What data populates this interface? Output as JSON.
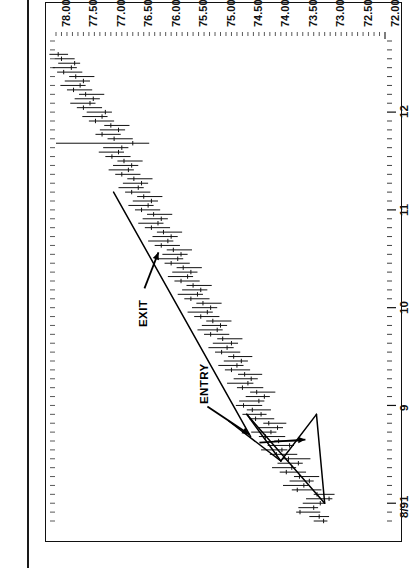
{
  "figure": {
    "title": "December 1991—Japanese Yen",
    "orientation": "rotated-90-ccw",
    "background": "#ffffff",
    "ink_color": "#111111"
  },
  "annotations": [
    {
      "name": "exit",
      "label": "EXIT",
      "arrow": "points-up-right-to-trendline"
    },
    {
      "name": "entry",
      "label": "ENTRY",
      "arrow": "points-down-left-to-breakout"
    }
  ],
  "chart_data": {
    "type": "line",
    "subtype": "ohlc-bar-chart",
    "title": "December 1991—Japanese Yen",
    "xlabel": "",
    "ylabel": "",
    "grid": false,
    "legend": false,
    "ylim": [
      72.0,
      78.0
    ],
    "yticks": [
      78.0,
      77.5,
      77.0,
      76.5,
      76.0,
      75.5,
      75.0,
      74.5,
      74.0,
      73.5,
      73.0,
      72.5,
      72.0
    ],
    "ytick_labels": [
      "78.00",
      "77.50",
      "77.00",
      "76.50",
      "76.00",
      "75.50",
      "75.00",
      "74.50",
      "74.00",
      "73.50",
      "73.00",
      "72.50",
      "72.00"
    ],
    "xtick_labels": [
      "8/91",
      "9",
      "10",
      "11",
      "12"
    ],
    "xtick_positions": [
      4,
      26,
      48,
      70,
      92
    ],
    "xlim": [
      0,
      108
    ],
    "minor_xticks_between": 4,
    "series": [
      {
        "name": "December 1991 Japanese Yen futures (daily OHLC)",
        "fields": [
          "index",
          "high",
          "low",
          "close"
        ],
        "bars": [
          [
            0,
            73.3,
            73.05,
            73.12
          ],
          [
            1,
            73.38,
            73.02,
            73.2
          ],
          [
            2,
            73.62,
            73.18,
            73.55
          ],
          [
            3,
            73.58,
            73.22,
            73.3
          ],
          [
            4,
            73.5,
            73.1,
            73.18
          ],
          [
            5,
            73.44,
            72.96,
            73.02
          ],
          [
            6,
            73.3,
            72.92,
            73.24
          ],
          [
            7,
            73.7,
            73.16,
            73.6
          ],
          [
            8,
            73.86,
            73.4,
            73.48
          ],
          [
            9,
            73.74,
            73.3,
            73.38
          ],
          [
            10,
            73.66,
            73.2,
            73.56
          ],
          [
            11,
            73.92,
            73.44,
            73.8
          ],
          [
            12,
            74.06,
            73.62,
            73.7
          ],
          [
            13,
            73.96,
            73.5,
            73.58
          ],
          [
            14,
            73.88,
            73.36,
            73.76
          ],
          [
            15,
            74.1,
            73.6,
            73.98
          ],
          [
            16,
            74.26,
            73.78,
            73.88
          ],
          [
            17,
            74.14,
            73.66,
            73.74
          ],
          [
            18,
            74.02,
            73.58,
            73.94
          ],
          [
            19,
            74.3,
            73.82,
            74.18
          ],
          [
            20,
            74.44,
            73.98,
            74.08
          ],
          [
            21,
            74.32,
            73.86,
            73.96
          ],
          [
            22,
            74.22,
            73.8,
            74.12
          ],
          [
            23,
            74.48,
            74.02,
            74.36
          ],
          [
            24,
            74.6,
            74.16,
            74.26
          ],
          [
            25,
            74.52,
            74.08,
            74.42
          ],
          [
            26,
            74.72,
            74.24,
            74.58
          ],
          [
            27,
            74.66,
            74.2,
            74.3
          ],
          [
            28,
            74.54,
            74.1,
            74.2
          ],
          [
            29,
            74.46,
            74.0,
            74.34
          ],
          [
            30,
            74.7,
            74.22,
            74.6
          ],
          [
            31,
            74.88,
            74.4,
            74.5
          ],
          [
            32,
            74.76,
            74.32,
            74.44
          ],
          [
            33,
            74.68,
            74.24,
            74.56
          ],
          [
            34,
            74.92,
            74.46,
            74.8
          ],
          [
            35,
            75.04,
            74.58,
            74.7
          ],
          [
            36,
            74.94,
            74.5,
            74.62
          ],
          [
            37,
            74.86,
            74.42,
            74.76
          ],
          [
            38,
            75.1,
            74.64,
            74.98
          ],
          [
            39,
            75.22,
            74.76,
            74.88
          ],
          [
            40,
            75.14,
            74.68,
            74.8
          ],
          [
            41,
            75.06,
            74.6,
            74.96
          ],
          [
            42,
            75.3,
            74.84,
            75.18
          ],
          [
            43,
            75.42,
            74.96,
            75.06
          ],
          [
            44,
            75.34,
            74.88,
            75.0
          ],
          [
            45,
            75.26,
            74.8,
            75.14
          ],
          [
            46,
            75.48,
            75.02,
            75.36
          ],
          [
            47,
            75.6,
            75.14,
            75.24
          ],
          [
            48,
            75.52,
            75.06,
            75.18
          ],
          [
            49,
            75.44,
            74.98,
            75.32
          ],
          [
            50,
            75.66,
            75.2,
            75.54
          ],
          [
            51,
            75.78,
            75.32,
            75.42
          ],
          [
            52,
            75.7,
            75.24,
            75.36
          ],
          [
            53,
            75.62,
            75.16,
            75.5
          ],
          [
            54,
            75.84,
            75.38,
            75.72
          ],
          [
            55,
            75.96,
            75.5,
            75.6
          ],
          [
            56,
            75.88,
            75.42,
            75.54
          ],
          [
            57,
            75.8,
            75.34,
            75.68
          ],
          [
            58,
            76.02,
            75.56,
            75.9
          ],
          [
            59,
            76.14,
            75.68,
            75.78
          ],
          [
            60,
            76.06,
            75.6,
            75.72
          ],
          [
            61,
            75.98,
            75.52,
            75.86
          ],
          [
            62,
            76.2,
            75.74,
            76.08
          ],
          [
            63,
            76.32,
            75.86,
            75.96
          ],
          [
            64,
            76.24,
            75.78,
            75.9
          ],
          [
            65,
            76.16,
            75.7,
            76.04
          ],
          [
            66,
            76.38,
            75.92,
            76.26
          ],
          [
            67,
            76.5,
            76.04,
            76.14
          ],
          [
            68,
            76.42,
            75.96,
            76.08
          ],
          [
            69,
            76.34,
            75.88,
            76.22
          ],
          [
            70,
            76.56,
            76.1,
            76.44
          ],
          [
            71,
            76.68,
            76.22,
            76.32
          ],
          [
            72,
            76.6,
            76.14,
            76.26
          ],
          [
            73,
            76.52,
            76.06,
            76.4
          ],
          [
            74,
            76.74,
            76.28,
            76.62
          ],
          [
            75,
            76.86,
            76.4,
            76.5
          ],
          [
            76,
            76.78,
            76.32,
            76.44
          ],
          [
            77,
            76.7,
            76.24,
            76.58
          ],
          [
            78,
            76.92,
            76.46,
            76.8
          ],
          [
            79,
            77.04,
            76.58,
            76.68
          ],
          [
            80,
            76.96,
            76.5,
            76.62
          ],
          [
            81,
            76.88,
            76.42,
            76.76
          ],
          [
            82,
            77.1,
            76.64,
            76.98
          ],
          [
            83,
            77.22,
            76.76,
            76.86
          ],
          [
            84,
            77.14,
            76.68,
            76.8
          ],
          [
            85,
            78.0,
            76.3,
            76.6
          ],
          [
            86,
            77.06,
            76.6,
            76.94
          ],
          [
            87,
            77.28,
            76.82,
            77.16
          ],
          [
            88,
            77.2,
            76.74,
            76.86
          ],
          [
            89,
            77.12,
            76.66,
            77.0
          ],
          [
            90,
            77.4,
            76.94,
            77.28
          ],
          [
            91,
            77.52,
            77.06,
            77.16
          ],
          [
            92,
            77.44,
            76.98,
            77.1
          ],
          [
            93,
            77.62,
            77.16,
            77.5
          ],
          [
            94,
            77.74,
            77.28,
            77.38
          ],
          [
            95,
            77.66,
            77.2,
            77.32
          ],
          [
            96,
            77.58,
            77.12,
            77.46
          ],
          [
            97,
            77.8,
            77.34,
            77.68
          ],
          [
            98,
            77.92,
            77.46,
            77.56
          ],
          [
            99,
            77.84,
            77.38,
            77.5
          ],
          [
            100,
            77.76,
            77.3,
            77.64
          ],
          [
            101,
            77.98,
            77.52,
            77.86
          ],
          [
            102,
            78.06,
            77.62,
            77.72
          ],
          [
            103,
            77.96,
            77.56,
            77.66
          ],
          [
            104,
            78.02,
            77.66,
            77.9
          ],
          [
            105,
            78.12,
            77.78,
            77.96
          ]
        ]
      }
    ],
    "trendlines": [
      {
        "name": "triangle-upper",
        "x1": 4.0,
        "y1": 73.1,
        "x2": 24.0,
        "y2": 74.52
      },
      {
        "name": "triangle-lower",
        "x1": 4.0,
        "y1": 73.1,
        "x2": 24.0,
        "y2": 73.25
      },
      {
        "name": "triangle-apex-upper",
        "x1": 24.0,
        "y1": 74.52,
        "x2": 13.5,
        "y2": 73.9
      },
      {
        "name": "triangle-apex-lower",
        "x1": 24.0,
        "y1": 73.25,
        "x2": 13.5,
        "y2": 73.9
      },
      {
        "name": "breakout-leg",
        "x1": 13.5,
        "y1": 73.9,
        "x2": 22.5,
        "y2": 74.85
      },
      {
        "name": "long-downtrend-resistance",
        "x1": 19.0,
        "y1": 74.45,
        "x2": 74.0,
        "y2": 76.95
      }
    ],
    "marked_points": [
      {
        "name": "entry",
        "label": "ENTRY",
        "x": 19.0,
        "y": 74.4
      },
      {
        "name": "exit",
        "label": "EXIT",
        "x": 60.0,
        "y": 76.35
      }
    ]
  }
}
